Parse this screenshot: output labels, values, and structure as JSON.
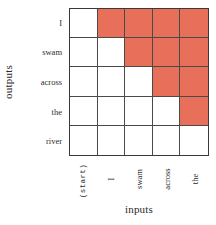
{
  "axes": {
    "y_title": "outputs",
    "x_title": "inputs"
  },
  "row_labels": [
    "I",
    "swam",
    "across",
    "the",
    "river"
  ],
  "col_labels": [
    "(start)",
    "I",
    "swam",
    "across",
    "the"
  ],
  "colors": {
    "filled_cell": "#e8705a",
    "empty_cell": "#ffffff",
    "grid_line": "#4a4a4a",
    "border": "#3a3a3a",
    "background": "#ffffff",
    "text": "#2b2b2b"
  },
  "chart_data": {
    "type": "heatmap",
    "title": "",
    "xlabel": "inputs",
    "ylabel": "outputs",
    "x": [
      "(start)",
      "I",
      "swam",
      "across",
      "the"
    ],
    "y": [
      "I",
      "swam",
      "across",
      "the",
      "river"
    ],
    "legend_position": "none",
    "grid": true,
    "value_meaning": {
      "0": "allowed (white)",
      "1": "masked (salmon)"
    },
    "values": [
      [
        0,
        1,
        1,
        1,
        1
      ],
      [
        0,
        0,
        1,
        1,
        1
      ],
      [
        0,
        0,
        0,
        1,
        1
      ],
      [
        0,
        0,
        0,
        0,
        1
      ],
      [
        0,
        0,
        0,
        0,
        0
      ]
    ]
  }
}
